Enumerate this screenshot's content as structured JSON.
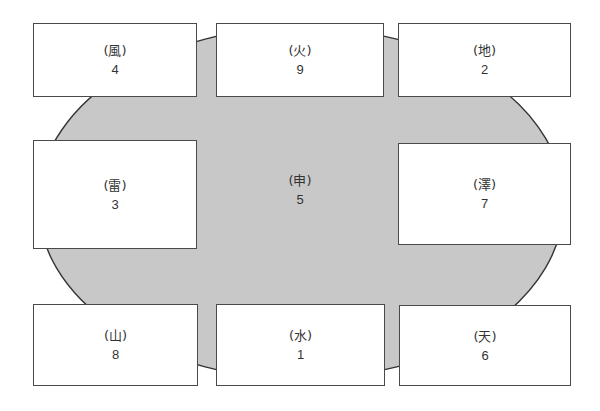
{
  "diagram": {
    "type": "lo-shu-magic-square-bagua",
    "oval": {
      "fill": "#c8c8c8",
      "stroke": "#333333",
      "cx": 301,
      "cy": 203,
      "rx": 263,
      "ry": 176
    },
    "center": {
      "label": "(申)",
      "number": "5"
    },
    "boxes": [
      {
        "id": "wind",
        "label": "(風)",
        "number": "4",
        "x": 33,
        "y": 23,
        "w": 164,
        "h": 74
      },
      {
        "id": "fire",
        "label": "(火)",
        "number": "9",
        "x": 216,
        "y": 23,
        "w": 168,
        "h": 74
      },
      {
        "id": "earth",
        "label": "(地)",
        "number": "2",
        "x": 398,
        "y": 23,
        "w": 173,
        "h": 74
      },
      {
        "id": "thunder",
        "label": "(雷)",
        "number": "3",
        "x": 33,
        "y": 140,
        "w": 164,
        "h": 109
      },
      {
        "id": "lake",
        "label": "(澤)",
        "number": "7",
        "x": 398,
        "y": 143,
        "w": 173,
        "h": 102
      },
      {
        "id": "mountain",
        "label": "(山)",
        "number": "8",
        "x": 33,
        "y": 304,
        "w": 165,
        "h": 82
      },
      {
        "id": "water",
        "label": "(水)",
        "number": "1",
        "x": 216,
        "y": 304,
        "w": 169,
        "h": 82
      },
      {
        "id": "heaven",
        "label": "(天)",
        "number": "6",
        "x": 399,
        "y": 305,
        "w": 172,
        "h": 81
      }
    ]
  }
}
